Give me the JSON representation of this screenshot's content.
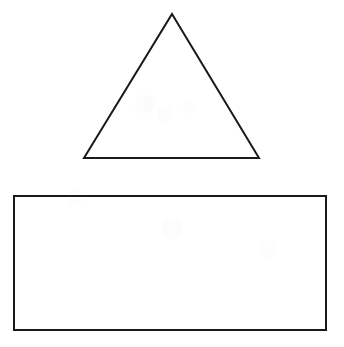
{
  "page": {
    "width": 344,
    "height": 347,
    "background_color": "#ffffff",
    "stroke_color": "#1a1a1a",
    "stroke_width": 2,
    "fill": "none",
    "has_text_labels": false
  },
  "shapes": [
    {
      "id": "triangle",
      "name": "triangle",
      "type": "polygon",
      "sides": 3,
      "fill": "none",
      "stroke_color": "#1a1a1a",
      "stroke_width": 2,
      "points": "172,14 259,158 84,158",
      "vertices": [
        {
          "label": "apex",
          "x": 172,
          "y": 14
        },
        {
          "label": "base-right",
          "x": 259,
          "y": 158
        },
        {
          "label": "base-left",
          "x": 84,
          "y": 158
        }
      ],
      "base_width": 175,
      "height": 144
    },
    {
      "id": "rectangle",
      "name": "rectangle",
      "type": "rect",
      "sides": 4,
      "fill": "none",
      "stroke_color": "#1a1a1a",
      "stroke_width": 2,
      "x": 14,
      "y": 196,
      "width": 312,
      "height": 134,
      "vertices": [
        {
          "label": "top-left",
          "x": 14,
          "y": 196
        },
        {
          "label": "top-right",
          "x": 326,
          "y": 196
        },
        {
          "label": "bottom-right",
          "x": 326,
          "y": 330
        },
        {
          "label": "bottom-left",
          "x": 14,
          "y": 330
        }
      ]
    }
  ]
}
